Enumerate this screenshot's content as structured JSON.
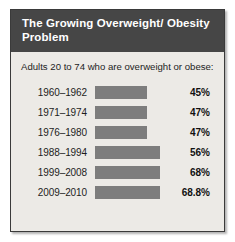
{
  "header": {
    "title": "The Growing Overweight/ Obesity Problem"
  },
  "subtitle": "Adults 20 to 74 who are overweight or obese:",
  "chart_data": {
    "type": "bar",
    "title": "The Growing Overweight/ Obesity Problem",
    "subtitle": "Adults 20 to 74 who are overweight or obese:",
    "xlabel": "",
    "ylabel": "",
    "orientation": "horizontal",
    "grid": false,
    "legend": false,
    "bar_color": "#7d7d7d",
    "categories": [
      "1960–1962",
      "1971–1974",
      "1976–1980",
      "1988–1994",
      "1999–2008",
      "2009–2010"
    ],
    "values": [
      45,
      47,
      47,
      56,
      68,
      68.8
    ],
    "value_labels": [
      "45%",
      "47%",
      "47%",
      "56%",
      "68%",
      "68.8%"
    ],
    "bar_pixel_widths": [
      52,
      52,
      52,
      65,
      65,
      65
    ],
    "rows": [
      {
        "period": "1960–1962",
        "value": 45,
        "label": "45%",
        "bar_width": 52
      },
      {
        "period": "1971–1974",
        "value": 47,
        "label": "47%",
        "bar_width": 52
      },
      {
        "period": "1976–1980",
        "value": 47,
        "label": "47%",
        "bar_width": 52
      },
      {
        "period": "1988–1994",
        "value": 56,
        "label": "56%",
        "bar_width": 65
      },
      {
        "period": "1999–2008",
        "value": 68,
        "label": "68%",
        "bar_width": 65
      },
      {
        "period": "2009–2010",
        "value": 68.8,
        "label": "68.8%",
        "bar_width": 65
      }
    ]
  }
}
